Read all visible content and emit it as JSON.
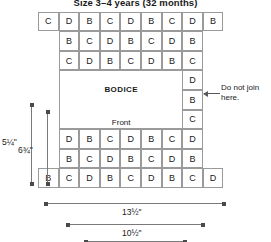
{
  "title": "Size 3–4 years (32 months)",
  "chart_data": {
    "type": "table",
    "title": "Size 3–4 years (32 months)",
    "cell_labels": [
      "B",
      "C",
      "D"
    ],
    "columns": 9,
    "rows": 9,
    "grid_rows": [
      {
        "index": 0,
        "start_col": 0,
        "cells": [
          "C",
          "D",
          "B",
          "C",
          "D",
          "B",
          "C",
          "D",
          "B"
        ]
      },
      {
        "index": 1,
        "start_col": 1,
        "cells": [
          "B",
          "C",
          "D",
          "B",
          "C",
          "D",
          "B"
        ]
      },
      {
        "index": 2,
        "start_col": 1,
        "cells": [
          "C",
          "D",
          "B",
          "C",
          "D",
          "B",
          "C"
        ]
      },
      {
        "index": 3,
        "start_col": 1,
        "cells": [
          "D"
        ],
        "right_col": 7,
        "right_cells": [
          "D"
        ]
      },
      {
        "index": 4,
        "start_col": 1,
        "cells": [
          "B"
        ],
        "right_col": 7,
        "right_cells": [
          "B"
        ]
      },
      {
        "index": 5,
        "start_col": 1,
        "cells": [
          "C"
        ],
        "right_col": 7,
        "right_cells": [
          "C"
        ]
      },
      {
        "index": 6,
        "start_col": 1,
        "cells": [
          "D",
          "B",
          "C",
          "D",
          "B",
          "C",
          "D"
        ]
      },
      {
        "index": 7,
        "start_col": 1,
        "cells": [
          "B",
          "C",
          "D",
          "B",
          "C",
          "D",
          "B"
        ]
      },
      {
        "index": 8,
        "start_col": 0,
        "cells": [
          "B",
          "C",
          "D",
          "B",
          "C",
          "D",
          "B",
          "C",
          "D"
        ]
      }
    ],
    "panel_labels": [
      {
        "text": "BODICE",
        "emphasis": "bold"
      },
      {
        "text": "Front",
        "emphasis": "normal"
      }
    ],
    "annotations": [
      {
        "text_line1": "Do not join",
        "text_line2": "here.",
        "kind": "callout-arrow"
      }
    ],
    "dimensions": [
      {
        "label": "5¼\"",
        "orientation": "vertical",
        "position": "outer-left"
      },
      {
        "label": "6¾\"",
        "orientation": "vertical",
        "position": "inner-left"
      },
      {
        "label": "13½\"",
        "orientation": "horizontal",
        "position": "upper"
      },
      {
        "label": "10½\"",
        "orientation": "horizontal",
        "position": "lower"
      }
    ]
  },
  "panels": {
    "bodice_label": "BODICE",
    "front_label": "Front"
  },
  "annotation": {
    "line1": "Do not join",
    "line2": "here."
  },
  "dimensions": {
    "left_outer": "5¼\"",
    "left_inner": "6¾\"",
    "bottom_upper": "13½\"",
    "bottom_lower": "10½\""
  }
}
